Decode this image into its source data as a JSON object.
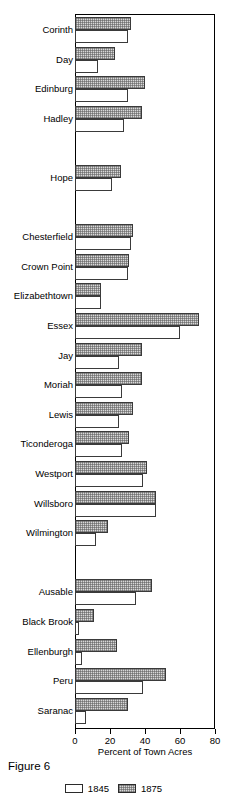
{
  "caption": "Figure 6",
  "legend": {
    "position": "bottom-center",
    "entries": [
      {
        "label": "1845",
        "style": "white"
      },
      {
        "label": "1875",
        "style": "shaded"
      }
    ]
  },
  "axis": {
    "xlabel": "Percent of Town Acres",
    "ticks": [
      "0",
      "20",
      "40",
      "60",
      "80"
    ]
  },
  "chart_data": {
    "type": "bar",
    "orientation": "horizontal",
    "title": "",
    "xlabel": "Percent of Town Acres",
    "ylabel": "",
    "xlim": [
      0,
      80
    ],
    "xticks": [
      0,
      20,
      40,
      60,
      80
    ],
    "grid": false,
    "legend_position": "bottom-center",
    "categories": [
      "Corinth",
      "Day",
      "Edinburg",
      "Hadley",
      "",
      "Hope",
      "",
      "Chesterfield",
      "Crown Point",
      "Elizabethtown",
      "Essex",
      "Jay",
      "Moriah",
      "Lewis",
      "Ticonderoga",
      "Westport",
      "Willsboro",
      "Wilmington",
      "",
      "Ausable",
      "Black Brook",
      "Ellenburgh",
      "Peru",
      "Saranac"
    ],
    "series": [
      {
        "name": "1845",
        "values": [
          30,
          13,
          30,
          28,
          null,
          21,
          null,
          32,
          30,
          15,
          60,
          25,
          27,
          25,
          27,
          39,
          46,
          12,
          null,
          35,
          2,
          4,
          39,
          6
        ]
      },
      {
        "name": "1875",
        "values": [
          32,
          23,
          40,
          38,
          null,
          26,
          null,
          33,
          31,
          15,
          71,
          38,
          38,
          33,
          31,
          41,
          46,
          19,
          null,
          44,
          11,
          24,
          52,
          30
        ]
      }
    ]
  }
}
